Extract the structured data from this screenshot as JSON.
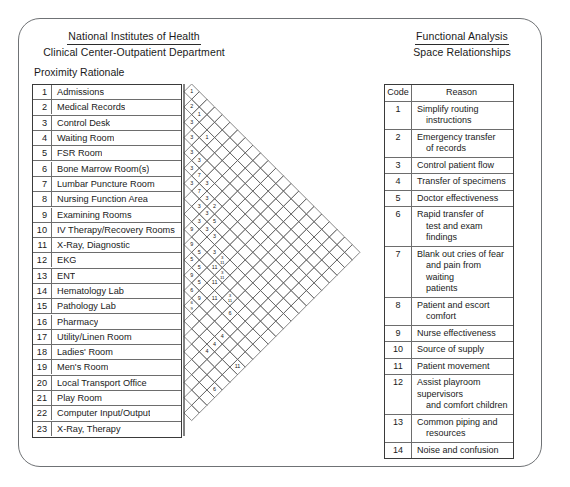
{
  "header": {
    "left_line1": "National Institutes of Health",
    "left_line2": "Clinical Center-Outpatient Department",
    "right_line1": "Functional Analysis",
    "right_line2": "Space Relationships",
    "section_title": "Proximity Rationale"
  },
  "activities": [
    {
      "num": "1",
      "name": "Admissions"
    },
    {
      "num": "2",
      "name": "Medical Records"
    },
    {
      "num": "3",
      "name": "Control Desk"
    },
    {
      "num": "4",
      "name": "Waiting Room"
    },
    {
      "num": "5",
      "name": "FSR Room"
    },
    {
      "num": "6",
      "name": "Bone Marrow Room(s)"
    },
    {
      "num": "7",
      "name": "Lumbar Puncture Room"
    },
    {
      "num": "8",
      "name": "Nursing Function Area"
    },
    {
      "num": "9",
      "name": "Examining Rooms"
    },
    {
      "num": "10",
      "name": "IV Therapy/Recovery Rooms"
    },
    {
      "num": "11",
      "name": "X-Ray, Diagnostic"
    },
    {
      "num": "12",
      "name": "EKG"
    },
    {
      "num": "13",
      "name": "ENT"
    },
    {
      "num": "14",
      "name": "Hematology Lab"
    },
    {
      "num": "15",
      "name": "Pathology Lab"
    },
    {
      "num": "16",
      "name": "Pharmacy"
    },
    {
      "num": "17",
      "name": "Utility/Linen Room"
    },
    {
      "num": "18",
      "name": "Ladies' Room"
    },
    {
      "num": "19",
      "name": "Men's Room"
    },
    {
      "num": "20",
      "name": "Local Transport Office"
    },
    {
      "num": "21",
      "name": "Play Room"
    },
    {
      "num": "22",
      "name": "Computer Input/Output"
    },
    {
      "num": "23",
      "name": "X-Ray, Therapy"
    }
  ],
  "reason_table": {
    "col_code": "Code",
    "col_reason": "Reason",
    "rows": [
      {
        "code": "1",
        "line1": "Simplify routing",
        "line2": "instructions"
      },
      {
        "code": "2",
        "line1": "Emergency transfer",
        "line2": "of records"
      },
      {
        "code": "3",
        "line1": "Control patient flow",
        "line2": ""
      },
      {
        "code": "4",
        "line1": "Transfer of specimens",
        "line2": ""
      },
      {
        "code": "5",
        "line1": "Doctor effectiveness",
        "line2": ""
      },
      {
        "code": "6",
        "line1": "Rapid transfer of",
        "line2": "test and exam findings"
      },
      {
        "code": "7",
        "line1": "Blank out cries of fear",
        "line2": "and pain from waiting",
        "line3": "patients"
      },
      {
        "code": "8",
        "line1": "Patient and escort",
        "line2": "comfort"
      },
      {
        "code": "9",
        "line1": "Nurse effectiveness",
        "line2": ""
      },
      {
        "code": "10",
        "line1": "Source of supply",
        "line2": ""
      },
      {
        "code": "11",
        "line1": "Patient movement",
        "line2": ""
      },
      {
        "code": "12",
        "line1": "Assist playroom supervisors",
        "line2": "and comfort children"
      },
      {
        "code": "13",
        "line1": "Common piping and",
        "line2": "resources"
      },
      {
        "code": "14",
        "line1": "Noise and confusion",
        "line2": ""
      }
    ]
  },
  "matrix": {
    "rows": 23,
    "cell": 15.3,
    "description": "Triangular proximity-rationale matrix; each diagonal cell pairs activity i with activity j and carries a reason code.",
    "entries": [
      {
        "i": 1,
        "j": 2,
        "code": "1"
      },
      {
        "i": 1,
        "j": 3,
        "code": "1"
      },
      {
        "i": 1,
        "j": 4,
        "code": "1"
      },
      {
        "i": 2,
        "j": 3,
        "code": "2"
      },
      {
        "i": 3,
        "j": 4,
        "code": "3"
      },
      {
        "i": 3,
        "j": 5,
        "code": "3"
      },
      {
        "i": 4,
        "j": 5,
        "code": "3"
      },
      {
        "i": 4,
        "j": 6,
        "code": "3"
      },
      {
        "i": 5,
        "j": 6,
        "code": "3"
      },
      {
        "i": 5,
        "j": 7,
        "code": "7"
      },
      {
        "i": 6,
        "j": 7,
        "code": "7"
      },
      {
        "i": 6,
        "j": 8,
        "code": "3"
      },
      {
        "i": 6,
        "j": 9,
        "code": "3"
      },
      {
        "i": 7,
        "j": 8,
        "code": "3"
      },
      {
        "i": 7,
        "j": 9,
        "code": "5"
      },
      {
        "i": 7,
        "j": 10,
        "code": "2"
      },
      {
        "i": 8,
        "j": 9,
        "code": "3"
      },
      {
        "i": 8,
        "j": 10,
        "code": "3"
      },
      {
        "i": 8,
        "j": 11,
        "code": "3/11"
      },
      {
        "i": 9,
        "j": 10,
        "code": "3"
      },
      {
        "i": 9,
        "j": 11,
        "code": "11"
      },
      {
        "i": 9,
        "j": 12,
        "code": "3/11"
      },
      {
        "i": 9,
        "j": 13,
        "code": "9"
      },
      {
        "i": 10,
        "j": 11,
        "code": "5"
      },
      {
        "i": 10,
        "j": 12,
        "code": "11"
      },
      {
        "i": 10,
        "j": 13,
        "code": "3/11"
      },
      {
        "i": 10,
        "j": 14,
        "code": "9"
      },
      {
        "i": 11,
        "j": 12,
        "code": "5"
      },
      {
        "i": 11,
        "j": 13,
        "code": "11"
      },
      {
        "i": 11,
        "j": 14,
        "code": "6"
      },
      {
        "i": 11,
        "j": 15,
        "code": "5"
      },
      {
        "i": 12,
        "j": 13,
        "code": "9"
      },
      {
        "i": 12,
        "j": 14,
        "code": "9"
      },
      {
        "i": 13,
        "j": 14,
        "code": "9"
      },
      {
        "i": 13,
        "j": 16,
        "code": "4"
      },
      {
        "i": 14,
        "j": 17,
        "code": "4"
      },
      {
        "i": 14,
        "j": 18,
        "code": "11"
      },
      {
        "i": 15,
        "j": 18,
        "code": "4"
      },
      {
        "i": 15,
        "j": 22,
        "code": "1"
      },
      {
        "i": 16,
        "j": 23,
        "code": "1"
      },
      {
        "i": 16,
        "j": 20,
        "code": "8"
      },
      {
        "i": 17,
        "j": 19,
        "code": "6"
      },
      {
        "i": 17,
        "j": 21,
        "code": "8"
      },
      {
        "i": 17,
        "j": 22,
        "code": "10"
      },
      {
        "i": 17,
        "j": 23,
        "code": "1"
      },
      {
        "i": 18,
        "j": 21,
        "code": "10"
      },
      {
        "i": 18,
        "j": 22,
        "code": "11"
      },
      {
        "i": 18,
        "j": 23,
        "code": "14"
      },
      {
        "i": 19,
        "j": 20,
        "code": "8/10"
      },
      {
        "i": 19,
        "j": 23,
        "code": "6"
      },
      {
        "i": 20,
        "j": 21,
        "code": "10"
      },
      {
        "i": 20,
        "j": 23,
        "code": "1"
      },
      {
        "i": 21,
        "j": 22,
        "code": "10"
      },
      {
        "i": 21,
        "j": 14,
        "code": "14"
      },
      {
        "i": 22,
        "j": 15,
        "code": "14"
      },
      {
        "i": 23,
        "j": 16,
        "code": "14"
      },
      {
        "i": 19,
        "j": 9,
        "code": "8"
      },
      {
        "i": 22,
        "j": 16,
        "code": "8/10"
      },
      {
        "i": 23,
        "j": 17,
        "code": "11"
      },
      {
        "i": 20,
        "j": 12,
        "code": "13"
      },
      {
        "i": 22,
        "j": 13,
        "code": "12"
      },
      {
        "i": 23,
        "j": 14,
        "code": "12"
      }
    ],
    "cells": [
      {
        "r": 1,
        "d": 1,
        "code": "1"
      },
      {
        "r": 2,
        "d": 1,
        "code": "2"
      },
      {
        "r": 2,
        "d": 2,
        "code": "1"
      },
      {
        "r": 3,
        "d": 3,
        "code": "1"
      },
      {
        "r": 3,
        "d": 1,
        "code": "3"
      },
      {
        "r": 4,
        "d": 1,
        "code": "3"
      },
      {
        "r": 5,
        "d": 1,
        "code": "3"
      },
      {
        "r": 5,
        "d": 2,
        "code": "3"
      },
      {
        "r": 6,
        "d": 1,
        "code": "3"
      },
      {
        "r": 6,
        "d": 2,
        "code": "7"
      },
      {
        "r": 6,
        "d": 3,
        "code": "3"
      },
      {
        "r": 7,
        "d": 1,
        "code": "3"
      },
      {
        "r": 7,
        "d": 2,
        "code": "7"
      },
      {
        "r": 7,
        "d": 3,
        "code": "3"
      },
      {
        "r": 7,
        "d": 4,
        "code": "2"
      },
      {
        "r": 8,
        "d": 2,
        "code": "3"
      },
      {
        "r": 8,
        "d": 3,
        "code": "3"
      },
      {
        "r": 8,
        "d": 4,
        "code": "5"
      },
      {
        "r": 9,
        "d": 2,
        "code": "3"
      },
      {
        "r": 9,
        "d": 3,
        "code": "3"
      },
      {
        "r": 9,
        "d": 4,
        "code": "3"
      },
      {
        "r": 10,
        "d": 1,
        "code": "9"
      },
      {
        "r": 10,
        "d": 4,
        "code": "3"
      },
      {
        "r": 10,
        "d": 5,
        "code": "3/11"
      },
      {
        "r": 11,
        "d": 1,
        "code": "9"
      },
      {
        "r": 11,
        "d": 2,
        "code": "5"
      },
      {
        "r": 11,
        "d": 4,
        "code": "11"
      },
      {
        "r": 11,
        "d": 5,
        "code": "3/11"
      },
      {
        "r": 12,
        "d": 1,
        "code": "5"
      },
      {
        "r": 12,
        "d": 2,
        "code": "5"
      },
      {
        "r": 12,
        "d": 4,
        "code": "11"
      },
      {
        "r": 12,
        "d": 6,
        "code": "3/11"
      },
      {
        "r": 13,
        "d": 1,
        "code": "9"
      },
      {
        "r": 13,
        "d": 2,
        "code": "5"
      },
      {
        "r": 13,
        "d": 4,
        "code": "11"
      },
      {
        "r": 13,
        "d": 6,
        "code": "6"
      },
      {
        "r": 14,
        "d": 1,
        "code": "6"
      },
      {
        "r": 14,
        "d": 2,
        "code": "9"
      },
      {
        "r": 15,
        "d": 1,
        "code": "6/9"
      },
      {
        "r": 15,
        "d": 5,
        "code": "4"
      },
      {
        "r": 15,
        "d": 11,
        "code": "1"
      },
      {
        "r": 16,
        "d": 4,
        "code": "4"
      },
      {
        "r": 16,
        "d": 7,
        "code": "11"
      },
      {
        "r": 16,
        "d": 11,
        "code": "1"
      },
      {
        "r": 17,
        "d": 3,
        "code": "4"
      },
      {
        "r": 18,
        "d": 9,
        "code": "8"
      },
      {
        "r": 18,
        "d": 13,
        "code": "1"
      },
      {
        "r": 19,
        "d": 4,
        "code": "6"
      },
      {
        "r": 19,
        "d": 7,
        "code": "10"
      },
      {
        "r": 19,
        "d": 9,
        "code": "8"
      },
      {
        "r": 19,
        "d": 11,
        "code": "1"
      },
      {
        "r": 20,
        "d": 7,
        "code": "10"
      },
      {
        "r": 20,
        "d": 10,
        "code": "11"
      },
      {
        "r": 20,
        "d": 12,
        "code": "14"
      },
      {
        "r": 21,
        "d": 6,
        "code": "8/10"
      },
      {
        "r": 21,
        "d": 12,
        "code": "6"
      },
      {
        "r": 22,
        "d": 6,
        "code": "10"
      },
      {
        "r": 22,
        "d": 12,
        "code": "1"
      },
      {
        "r": 23,
        "d": 5,
        "code": "10"
      }
    ]
  }
}
